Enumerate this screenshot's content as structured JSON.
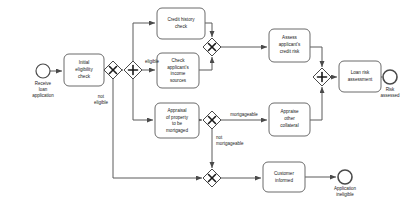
{
  "diagram": {
    "type": "bpmn-process-diagram",
    "colors": {
      "background": "#ffffff",
      "shape_fill": "#ffffff",
      "shape_stroke": "#6b6b6b",
      "flow_stroke": "#5a5a5a",
      "text": "#1a1a1a"
    }
  },
  "events": [
    {
      "id": "start-receive-loan-application",
      "kind": "start",
      "label": "Receive\nloan\napplication",
      "lines": [
        "Receive",
        "loan",
        "application"
      ],
      "cx": 43,
      "cy": 71,
      "r": 7
    },
    {
      "id": "end-risk-assessed",
      "kind": "end",
      "label": "Risk\nassessed",
      "lines": [
        "Risk",
        "assessed"
      ],
      "cx": 390,
      "cy": 77,
      "r": 7
    },
    {
      "id": "end-application-ineligible",
      "kind": "end",
      "label": "Application\nineligible",
      "lines": [
        "Application",
        "ineligible"
      ],
      "cx": 345,
      "cy": 177,
      "r": 7
    }
  ],
  "tasks": [
    {
      "id": "task-initial-eligibility-check",
      "label": "Initial eligibility check",
      "lines": [
        "Initial",
        "eligibility",
        "check"
      ],
      "x": 64,
      "y": 54,
      "w": 40,
      "h": 32
    },
    {
      "id": "task-credit-history-check",
      "label": "Credit history check",
      "lines": [
        "Credit history",
        "check"
      ],
      "x": 157,
      "y": 8,
      "w": 48,
      "h": 31
    },
    {
      "id": "task-check-applicants-income-sources",
      "label": "Check applicant's income sources",
      "lines": [
        "Check",
        "applicant's",
        "income",
        "sources"
      ],
      "x": 157,
      "y": 53,
      "w": 42,
      "h": 35
    },
    {
      "id": "task-appraisal-of-property",
      "label": "Appraisal of property to be mortgaged",
      "lines": [
        "Appraisal",
        "of property",
        "to be",
        "mortgaged"
      ],
      "x": 155,
      "y": 103,
      "w": 44,
      "h": 35
    },
    {
      "id": "task-assess-applicants-credit-risk",
      "label": "Assess applicant's credit risk",
      "lines": [
        "Assess",
        "applicant's",
        "credit risk"
      ],
      "x": 269,
      "y": 29,
      "w": 41,
      "h": 33
    },
    {
      "id": "task-appraise-other-collateral",
      "label": "Appraise other collateral",
      "lines": [
        "Appraise",
        "other",
        "collateral"
      ],
      "x": 269,
      "y": 103,
      "w": 41,
      "h": 33
    },
    {
      "id": "task-loan-risk-assessment",
      "label": "Loan risk assessment",
      "lines": [
        "Loan risk",
        "assessment"
      ],
      "x": 339,
      "y": 61,
      "w": 42,
      "h": 31
    },
    {
      "id": "task-customer-informed",
      "label": "Customer informed",
      "lines": [
        "Customer",
        "informed"
      ],
      "x": 263,
      "y": 162,
      "w": 42,
      "h": 30
    }
  ],
  "gateways": [
    {
      "id": "gateway-eligibility-decision",
      "kind": "exclusive",
      "symbol": "X",
      "cx": 113,
      "cy": 70,
      "half": 9
    },
    {
      "id": "gateway-parallel-split",
      "kind": "parallel",
      "symbol": "+",
      "cx": 133,
      "cy": 70,
      "half": 9
    },
    {
      "id": "gateway-credit-checks-merge",
      "kind": "exclusive",
      "symbol": "X",
      "cx": 212,
      "cy": 47,
      "half": 9
    },
    {
      "id": "gateway-mortgageable-decision",
      "kind": "exclusive",
      "symbol": "X",
      "cx": 212,
      "cy": 120,
      "half": 9
    },
    {
      "id": "gateway-parallel-join",
      "kind": "parallel",
      "symbol": "+",
      "cx": 322,
      "cy": 77,
      "half": 9
    },
    {
      "id": "gateway-ineligible-merge",
      "kind": "exclusive",
      "symbol": "X",
      "cx": 212,
      "cy": 178,
      "half": 9
    }
  ],
  "flow_labels": [
    {
      "id": "label-eligible",
      "text": "eligible",
      "x": 123,
      "y": 64,
      "anchor": "center"
    },
    {
      "id": "label-not-eligible",
      "text": "not eligible",
      "lines": [
        "not",
        "eligible"
      ],
      "x": 101,
      "y": 100,
      "anchor": "center"
    },
    {
      "id": "label-mortgageable",
      "text": "mortgageable",
      "x": 244,
      "y": 115,
      "anchor": "center"
    },
    {
      "id": "label-not-mortgageable",
      "text": "not mortgageable",
      "lines": [
        "not",
        "mortgageable"
      ],
      "x": 222,
      "y": 141,
      "anchor": "start"
    }
  ],
  "flows": [
    {
      "id": "flow-start-to-initial-check",
      "from": "start-receive-loan-application",
      "to": "task-initial-eligibility-check"
    },
    {
      "id": "flow-initial-check-to-eligibility-gateway",
      "from": "task-initial-eligibility-check",
      "to": "gateway-eligibility-decision"
    },
    {
      "id": "flow-eligible-to-parallel-split",
      "from": "gateway-eligibility-decision",
      "to": "gateway-parallel-split",
      "label": "eligible"
    },
    {
      "id": "flow-not-eligible-to-merge",
      "from": "gateway-eligibility-decision",
      "to": "gateway-ineligible-merge",
      "label": "not eligible"
    },
    {
      "id": "flow-split-to-credit-history",
      "from": "gateway-parallel-split",
      "to": "task-credit-history-check"
    },
    {
      "id": "flow-split-to-income-sources",
      "from": "gateway-parallel-split",
      "to": "task-check-applicants-income-sources"
    },
    {
      "id": "flow-split-to-appraisal",
      "from": "gateway-parallel-split",
      "to": "task-appraisal-of-property"
    },
    {
      "id": "flow-credit-history-to-merge",
      "from": "task-credit-history-check",
      "to": "gateway-credit-checks-merge"
    },
    {
      "id": "flow-income-sources-to-merge",
      "from": "task-check-applicants-income-sources",
      "to": "gateway-credit-checks-merge"
    },
    {
      "id": "flow-merge-to-assess-credit-risk",
      "from": "gateway-credit-checks-merge",
      "to": "task-assess-applicants-credit-risk"
    },
    {
      "id": "flow-appraisal-to-mortgageable-gateway",
      "from": "task-appraisal-of-property",
      "to": "gateway-mortgageable-decision"
    },
    {
      "id": "flow-mortgageable-to-appraise-collateral",
      "from": "gateway-mortgageable-decision",
      "to": "task-appraise-other-collateral",
      "label": "mortgageable"
    },
    {
      "id": "flow-not-mortgageable-to-ineligible-merge",
      "from": "gateway-mortgageable-decision",
      "to": "gateway-ineligible-merge",
      "label": "not mortgageable"
    },
    {
      "id": "flow-credit-risk-to-join",
      "from": "task-assess-applicants-credit-risk",
      "to": "gateway-parallel-join"
    },
    {
      "id": "flow-collateral-to-join",
      "from": "task-appraise-other-collateral",
      "to": "gateway-parallel-join"
    },
    {
      "id": "flow-join-to-loan-risk-assessment",
      "from": "gateway-parallel-join",
      "to": "task-loan-risk-assessment"
    },
    {
      "id": "flow-loan-risk-to-end",
      "from": "task-loan-risk-assessment",
      "to": "end-risk-assessed"
    },
    {
      "id": "flow-ineligible-merge-to-customer-informed",
      "from": "gateway-ineligible-merge",
      "to": "task-customer-informed"
    },
    {
      "id": "flow-customer-informed-to-end",
      "from": "task-customer-informed",
      "to": "end-application-ineligible"
    }
  ]
}
